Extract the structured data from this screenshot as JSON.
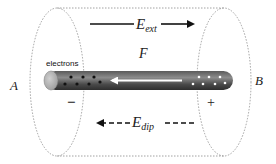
{
  "diagram": {
    "labels": {
      "left_end": "A",
      "right_end": "B",
      "electrons": "electrons",
      "force": "F",
      "negative_sign": "−",
      "positive_sign": "+"
    },
    "external_field": {
      "symbol": "E",
      "subscript": "ext",
      "direction": "right",
      "line_style": "solid"
    },
    "dipole_field": {
      "symbol": "E",
      "subscript": "dip",
      "direction": "left",
      "line_style": "dashed"
    },
    "rod": {
      "electrons_left_count": 7,
      "holes_right_count": 7,
      "force_arrow_direction": "left"
    },
    "colors": {
      "rod_dark": "#3a3a3a",
      "rod_light": "#8a8a8a",
      "cap": "#b0b0b0",
      "outline_dashed": "#8a8a8a",
      "arrow": "#111111",
      "force_arrow": "#ffffff"
    }
  }
}
